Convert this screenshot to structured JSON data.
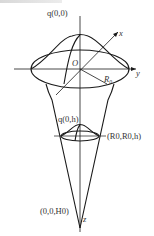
{
  "diagram": {
    "labels": {
      "q_top": "q(0,0)",
      "x_axis": "x",
      "y_axis": "y",
      "z_axis": "z",
      "origin": "O",
      "radius": "R",
      "radius_sub": "0",
      "q_h": "q(0,h)",
      "point_rh": "(R",
      "point_rh_full": "(R0,R0,h)",
      "apex": "(0,0,H",
      "apex_full": "(0,0,H0)"
    },
    "colors": {
      "stroke": "#1a1a1a",
      "text": "#333333",
      "axis": "#444444"
    }
  }
}
